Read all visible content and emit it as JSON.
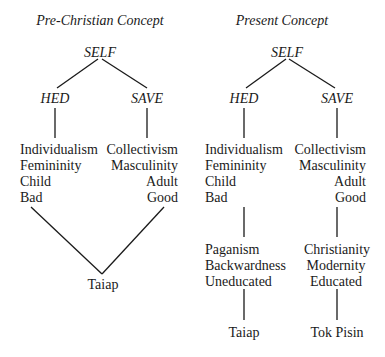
{
  "left": {
    "title": "Pre-Christian Concept",
    "root": "SELF",
    "hed": "HED",
    "save": "SAVE",
    "hed_traits": [
      "Individualism",
      "Femininity",
      "Child",
      "Bad"
    ],
    "save_traits": [
      "Collectivism",
      "Masculinity",
      "Adult",
      "Good"
    ],
    "language": "Taiap"
  },
  "right": {
    "title": "Present Concept",
    "root": "SELF",
    "hed": "HED",
    "save": "SAVE",
    "hed_traits": [
      "Individualism",
      "Femininity",
      "Child",
      "Bad"
    ],
    "save_traits": [
      "Collectivism",
      "Masculinity",
      "Adult",
      "Good"
    ],
    "hed_associations": [
      "Paganism",
      "Backwardness",
      "Uneducated"
    ],
    "save_associations": [
      "Christianity",
      "Modernity",
      "Educated"
    ],
    "hed_language": "Taiap",
    "save_language": "Tok Pisin"
  },
  "colors": {
    "text": "#1a1a1a",
    "line": "#1a1a1a",
    "background": "#ffffff"
  }
}
